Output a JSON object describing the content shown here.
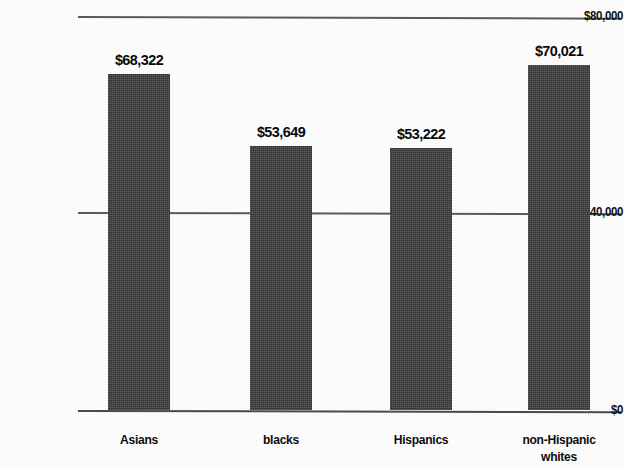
{
  "chart_data": {
    "type": "bar",
    "title": "",
    "xlabel": "",
    "ylabel": "",
    "categories": [
      "Asians",
      "blacks",
      "Hispanics",
      "non-Hispanic whites"
    ],
    "values": [
      68322,
      53649,
      53222,
      70021
    ],
    "value_labels": [
      "$68,322",
      "$53,649",
      "$53,222",
      "$70,021"
    ],
    "ylim": [
      0,
      80000
    ],
    "ytick_values": [
      0,
      40000,
      80000
    ],
    "ytick_labels": [
      "$0",
      "$40,000",
      "$80,000"
    ],
    "grid": true,
    "legend": "none",
    "bar_color": "#3d3d3d",
    "axis_color": "#5a5a5a"
  },
  "axis": {
    "y_top": "$80,000",
    "y_mid": "$40,000",
    "y_base": "$0"
  },
  "bars": [
    {
      "category": "Asians",
      "value_label": "$68,322",
      "label_line1": "Asians",
      "label_line2": ""
    },
    {
      "category": "blacks",
      "value_label": "$53,649",
      "label_line1": "blacks",
      "label_line2": ""
    },
    {
      "category": "Hispanics",
      "value_label": "$53,222",
      "label_line1": "Hispanics",
      "label_line2": ""
    },
    {
      "category": "non-Hispanic whites",
      "value_label": "$70,021",
      "label_line1": "non-Hispanic",
      "label_line2": "whites"
    }
  ]
}
